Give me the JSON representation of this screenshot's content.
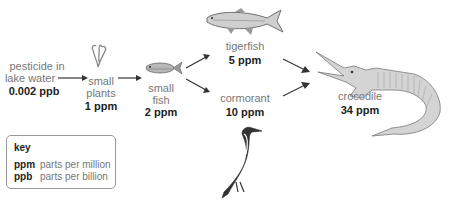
{
  "diagram": {
    "type": "food-chain biomagnification",
    "nodes": [
      {
        "id": "water",
        "label_lines": [
          "pesticide in",
          "lake water"
        ],
        "value": "0.002 ppb"
      },
      {
        "id": "plants",
        "label_lines": [
          "small",
          "plants"
        ],
        "value": "1 ppm"
      },
      {
        "id": "small_fish",
        "label_lines": [
          "small",
          "fish"
        ],
        "value": "2 ppm"
      },
      {
        "id": "tigerfish",
        "label_lines": [
          "tigerfish"
        ],
        "value": "5 ppm"
      },
      {
        "id": "cormorant",
        "label_lines": [
          "cormorant"
        ],
        "value": "10 ppm"
      },
      {
        "id": "crocodile",
        "label_lines": [
          "crocodile"
        ],
        "value": "34 ppm"
      }
    ],
    "edges": [
      [
        "water",
        "plants"
      ],
      [
        "plants",
        "small_fish"
      ],
      [
        "small_fish",
        "tigerfish"
      ],
      [
        "small_fish",
        "cormorant"
      ],
      [
        "tigerfish",
        "crocodile"
      ],
      [
        "cormorant",
        "crocodile"
      ]
    ]
  },
  "key": {
    "title": "key",
    "items": [
      {
        "abbr": "ppm",
        "meaning": "parts per million"
      },
      {
        "abbr": "ppb",
        "meaning": "parts per billion"
      }
    ]
  },
  "colors": {
    "text_label": "#777777",
    "text_value": "#222222",
    "arrow": "#333333",
    "key_border": "#999999"
  }
}
